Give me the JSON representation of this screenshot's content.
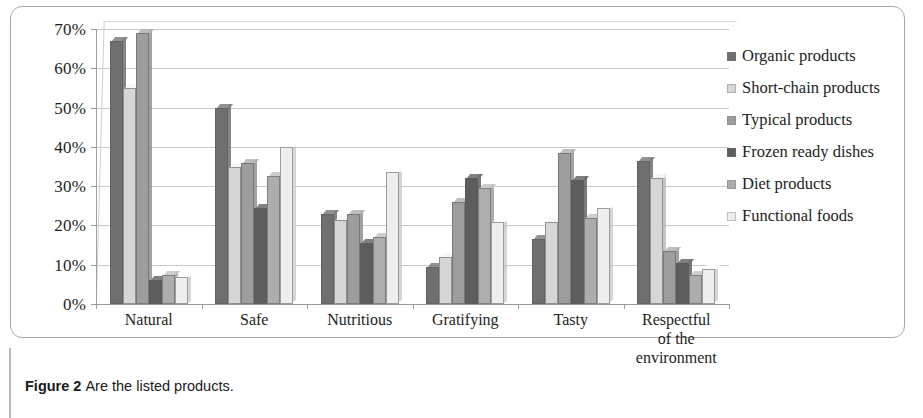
{
  "caption": {
    "bold": "Figure 2",
    "rest": "Are the listed products."
  },
  "chart_data": {
    "type": "bar",
    "title": "",
    "xlabel": "",
    "ylabel": "",
    "ylim": [
      0,
      70
    ],
    "ytick_labels": [
      "70%",
      "60%",
      "50%",
      "40%",
      "30%",
      "20%",
      "10%",
      "0%"
    ],
    "ytick_values": [
      70,
      60,
      50,
      40,
      30,
      20,
      10,
      0
    ],
    "grid": true,
    "legend_position": "right",
    "categories": [
      "Natural",
      "Safe",
      "Nutritious",
      "Gratifying",
      "Tasty",
      "Respectful of the environment"
    ],
    "category_label_lines": [
      [
        "Natural"
      ],
      [
        "Safe"
      ],
      [
        "Nutritious"
      ],
      [
        "Gratifying"
      ],
      [
        "Tasty"
      ],
      [
        "Respectful",
        "of the",
        "environment"
      ]
    ],
    "series": [
      {
        "name": "Organic products",
        "color": "#6f6f6f",
        "values": [
          67,
          50,
          23,
          9.5,
          16.5,
          36.5
        ]
      },
      {
        "name": "Short-chain products",
        "color": "#d6d6d6",
        "values": [
          55,
          35,
          21.5,
          12,
          21,
          32
        ]
      },
      {
        "name": "Typical products",
        "color": "#9d9d9d",
        "values": [
          69,
          36,
          23,
          26,
          38.5,
          13.5
        ]
      },
      {
        "name": "Frozen ready dishes",
        "color": "#5d5d5d",
        "values": [
          6,
          24.5,
          15.5,
          32,
          31.5,
          10.5
        ]
      },
      {
        "name": "Diet products",
        "color": "#adadad",
        "values": [
          7.5,
          32.5,
          17,
          29.5,
          22,
          7.5
        ]
      },
      {
        "name": "Functional foods",
        "color": "#eeeeee",
        "values": [
          7,
          40,
          33.5,
          21,
          24.5,
          9
        ]
      }
    ]
  }
}
